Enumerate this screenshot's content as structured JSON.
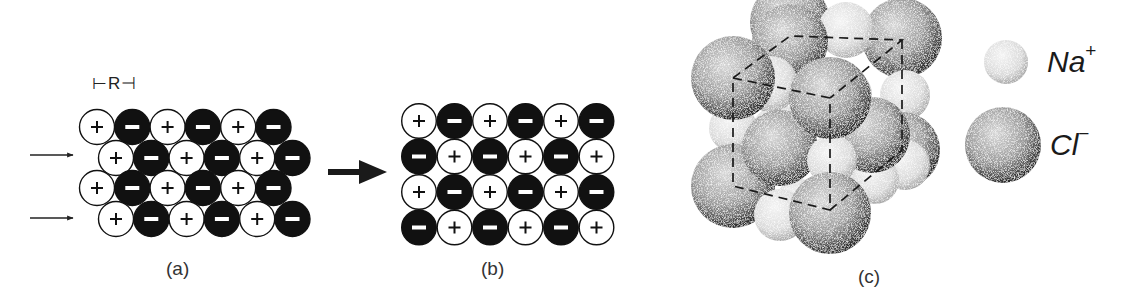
{
  "figure": {
    "panels": [
      {
        "id": "a",
        "caption": "(a)",
        "description": "Ionic crystal layers displaced by a shear force (offset rows)",
        "spacing_label": "⊢R⊣",
        "rows": [
          [
            "+",
            "-",
            "+",
            "-",
            "+",
            "-"
          ],
          [
            "+",
            "-",
            "+",
            "-",
            "+",
            "-"
          ],
          [
            "+",
            "-",
            "+",
            "-",
            "+",
            "-"
          ],
          [
            "+",
            "-",
            "+",
            "-",
            "+",
            "-"
          ]
        ],
        "row_offsets": [
          0,
          1,
          0,
          1
        ],
        "shear_arrows": 2
      },
      {
        "id": "b",
        "caption": "(b)",
        "description": "Resulting layer alignment after displacement of one spacing R",
        "rows": [
          [
            "+",
            "-",
            "+",
            "-",
            "+",
            "-"
          ],
          [
            "-",
            "+",
            "-",
            "+",
            "-",
            "+"
          ],
          [
            "+",
            "-",
            "+",
            "-",
            "+",
            "-"
          ],
          [
            "-",
            "+",
            "-",
            "+",
            "-",
            "+"
          ]
        ]
      },
      {
        "id": "c",
        "caption": "(c)",
        "description": "Space-filling model of the NaCl (rock salt) unit cell with dashed cube edges"
      }
    ],
    "transition_arrow": "→",
    "legend": [
      {
        "ion": "Na",
        "charge": "+",
        "size": "small"
      },
      {
        "ion": "Cl",
        "charge": "−",
        "size": "large"
      }
    ],
    "symbols": {
      "cation": "+",
      "anion": "−"
    },
    "colors": {
      "cation_fill": "#ffffff",
      "anion_fill": "#111111",
      "stroke": "#111111",
      "background": "#ffffff"
    }
  }
}
